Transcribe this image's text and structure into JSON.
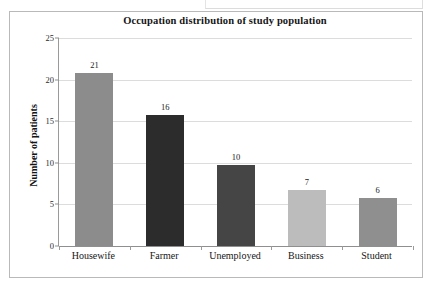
{
  "figure": {
    "title": "Occupation distribution of study population"
  },
  "chart_data": {
    "type": "bar",
    "title": "Occupation distribution of study population",
    "xlabel": "",
    "ylabel": "Number of patients",
    "categories": [
      "Housewife",
      "Farmer",
      "Unemployed",
      "Business",
      "Student"
    ],
    "values": [
      21,
      16,
      10,
      7,
      6
    ],
    "value_labels": [
      "21",
      "16",
      "10",
      "7",
      "6"
    ],
    "ylim": [
      0,
      25
    ],
    "yticks": [
      0,
      5,
      10,
      15,
      20,
      25
    ],
    "ytick_labels": [
      "0",
      "5",
      "10",
      "15",
      "20",
      "25"
    ],
    "grid": true,
    "grid_axis": "y",
    "legend": false,
    "bar_colors": [
      "#8c8c8c",
      "#2c2c2c",
      "#454545",
      "#bcbcbc",
      "#8f8f8f"
    ]
  },
  "style": {
    "plot_background": "#ffffff",
    "gridline_color": "#dcdcdc",
    "axis_color": "#8f8f8f",
    "frame_color": "#b9b9b9",
    "text_color": "#1a1a1a"
  }
}
